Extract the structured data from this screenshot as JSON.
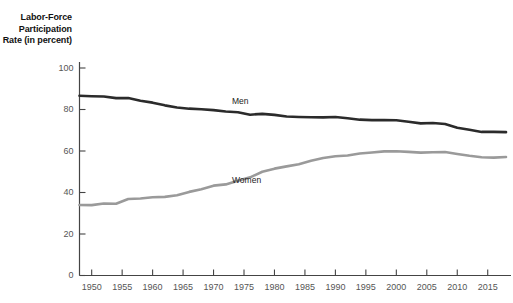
{
  "chart_data": {
    "type": "line",
    "title": "",
    "ylabel": "Labor-Force Participation Rate (in percent)",
    "ylabel_lines": [
      "Labor-Force",
      "Participation",
      "Rate (in percent)"
    ],
    "xlabel": "",
    "xlim": [
      1948,
      2018
    ],
    "ylim": [
      0,
      100
    ],
    "yticks": [
      0,
      20,
      40,
      60,
      80,
      100
    ],
    "ytick_labels": [
      "0",
      "20",
      "40",
      "60",
      "80",
      "100"
    ],
    "xticks": [
      1950,
      1955,
      1960,
      1965,
      1970,
      1975,
      1980,
      1985,
      1990,
      1995,
      2000,
      2005,
      2010,
      2015
    ],
    "xtick_labels": [
      "1950",
      "1955",
      "1960",
      "1965",
      "1970",
      "1975",
      "1980",
      "1985",
      "1990",
      "1995",
      "2000",
      "2005",
      "2010",
      "2015"
    ],
    "grid": false,
    "legend_position": "inline-annotation",
    "x": [
      1948,
      1950,
      1952,
      1954,
      1956,
      1958,
      1960,
      1962,
      1964,
      1966,
      1968,
      1970,
      1972,
      1974,
      1976,
      1978,
      1980,
      1982,
      1984,
      1986,
      1988,
      1990,
      1992,
      1994,
      1996,
      1998,
      2000,
      2002,
      2004,
      2006,
      2008,
      2010,
      2012,
      2014,
      2016,
      2018
    ],
    "series": [
      {
        "name": "Men",
        "label": "Men",
        "color": "#2b2b2b",
        "values": [
          86.6,
          86.4,
          86.3,
          85.5,
          85.5,
          84.2,
          83.3,
          82.0,
          81.0,
          80.4,
          80.1,
          79.7,
          79.0,
          78.7,
          77.5,
          77.9,
          77.4,
          76.6,
          76.4,
          76.3,
          76.2,
          76.4,
          75.8,
          75.1,
          74.9,
          74.9,
          74.8,
          74.1,
          73.3,
          73.5,
          73.0,
          71.2,
          70.2,
          69.2,
          69.2,
          69.1
        ]
      },
      {
        "name": "Women",
        "label": "Women",
        "color": "#9a9a9a",
        "values": [
          34.0,
          33.9,
          34.7,
          34.6,
          36.9,
          37.1,
          37.7,
          37.9,
          38.7,
          40.3,
          41.6,
          43.3,
          43.9,
          45.7,
          47.3,
          50.0,
          51.5,
          52.6,
          53.6,
          55.3,
          56.6,
          57.5,
          57.8,
          58.8,
          59.3,
          59.8,
          59.9,
          59.6,
          59.2,
          59.4,
          59.5,
          58.6,
          57.7,
          57.0,
          56.8,
          57.1
        ]
      }
    ],
    "annotations": [
      {
        "text": "Men",
        "x": 1975,
        "y": 83.5
      },
      {
        "text": "Women",
        "x": 1975,
        "y": 45.5
      }
    ],
    "colors": {
      "men": "#2b2b2b",
      "women": "#9a9a9a",
      "axis": "#444444",
      "tick_text": "#555555",
      "title_text": "#111111",
      "background": "#ffffff"
    }
  }
}
